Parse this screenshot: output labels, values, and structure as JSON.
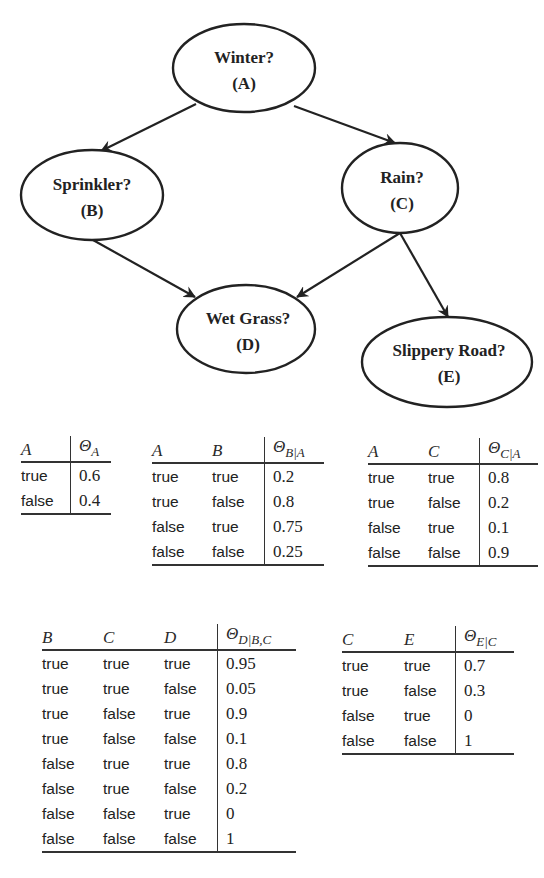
{
  "diagram": {
    "nodes": [
      {
        "id": "A",
        "label": "Winter?",
        "var": "(A)"
      },
      {
        "id": "B",
        "label": "Sprinkler?",
        "var": "(B)"
      },
      {
        "id": "C",
        "label": "Rain?",
        "var": "(C)"
      },
      {
        "id": "D",
        "label": "Wet Grass?",
        "var": "(D)"
      },
      {
        "id": "E",
        "label": "Slippery Road?",
        "var": "(E)"
      }
    ],
    "edges": [
      {
        "from": "A",
        "to": "B"
      },
      {
        "from": "A",
        "to": "C"
      },
      {
        "from": "B",
        "to": "D"
      },
      {
        "from": "C",
        "to": "D"
      },
      {
        "from": "C",
        "to": "E"
      }
    ],
    "colors": {
      "stroke": "#222222",
      "text": "#222222",
      "background": "#ffffff"
    }
  },
  "tables": {
    "theta_a": {
      "headers": [
        "A"
      ],
      "param": "Θ",
      "param_sub": "A",
      "rows": [
        {
          "cells": [
            "true"
          ],
          "value": "0.6"
        },
        {
          "cells": [
            "false"
          ],
          "value": "0.4"
        }
      ]
    },
    "theta_b_a": {
      "headers": [
        "A",
        "B"
      ],
      "param": "Θ",
      "param_sub": "B|A",
      "rows": [
        {
          "cells": [
            "true",
            "true"
          ],
          "value": "0.2"
        },
        {
          "cells": [
            "true",
            "false"
          ],
          "value": "0.8"
        },
        {
          "cells": [
            "false",
            "true"
          ],
          "value": "0.75"
        },
        {
          "cells": [
            "false",
            "false"
          ],
          "value": "0.25"
        }
      ]
    },
    "theta_c_a": {
      "headers": [
        "A",
        "C"
      ],
      "param": "Θ",
      "param_sub": "C|A",
      "rows": [
        {
          "cells": [
            "true",
            "true"
          ],
          "value": "0.8"
        },
        {
          "cells": [
            "true",
            "false"
          ],
          "value": "0.2"
        },
        {
          "cells": [
            "false",
            "true"
          ],
          "value": "0.1"
        },
        {
          "cells": [
            "false",
            "false"
          ],
          "value": "0.9"
        }
      ]
    },
    "theta_d_bc": {
      "headers": [
        "B",
        "C",
        "D"
      ],
      "param": "Θ",
      "param_sub": "D|B,C",
      "rows": [
        {
          "cells": [
            "true",
            "true",
            "true"
          ],
          "value": "0.95"
        },
        {
          "cells": [
            "true",
            "true",
            "false"
          ],
          "value": "0.05"
        },
        {
          "cells": [
            "true",
            "false",
            "true"
          ],
          "value": "0.9"
        },
        {
          "cells": [
            "true",
            "false",
            "false"
          ],
          "value": "0.1"
        },
        {
          "cells": [
            "false",
            "true",
            "true"
          ],
          "value": "0.8"
        },
        {
          "cells": [
            "false",
            "true",
            "false"
          ],
          "value": "0.2"
        },
        {
          "cells": [
            "false",
            "false",
            "true"
          ],
          "value": "0"
        },
        {
          "cells": [
            "false",
            "false",
            "false"
          ],
          "value": "1"
        }
      ]
    },
    "theta_e_c": {
      "headers": [
        "C",
        "E"
      ],
      "param": "Θ",
      "param_sub": "E|C",
      "rows": [
        {
          "cells": [
            "true",
            "true"
          ],
          "value": "0.7"
        },
        {
          "cells": [
            "true",
            "false"
          ],
          "value": "0.3"
        },
        {
          "cells": [
            "false",
            "true"
          ],
          "value": "0"
        },
        {
          "cells": [
            "false",
            "false"
          ],
          "value": "1"
        }
      ]
    }
  }
}
